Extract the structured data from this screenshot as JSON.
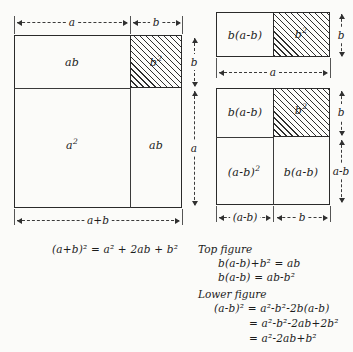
{
  "main_figure": {
    "name": "left-square-diagram",
    "cells": [
      {
        "id": "ab-top",
        "label": "ab",
        "sup": ""
      },
      {
        "id": "b-squared",
        "label": "b",
        "sup": "2"
      },
      {
        "id": "a-squared",
        "label": "a",
        "sup": "2"
      },
      {
        "id": "ab-right",
        "label": "ab",
        "sup": ""
      }
    ],
    "dimensions": {
      "top_left": "a",
      "top_right": "b",
      "right_upper": "b",
      "right_lower": "a",
      "bottom": "a+b"
    },
    "equation": "(a+b)² = a² + 2ab + b²"
  },
  "top_figure": {
    "name": "top-right-rectangle-diagram",
    "cells": [
      {
        "id": "b-a-minus-b",
        "label": "b(a-b)"
      },
      {
        "id": "b-squared",
        "label": "b",
        "sup": "2"
      }
    ],
    "dimensions": {
      "right": "b",
      "bottom": "a"
    }
  },
  "lower_figure": {
    "name": "lower-right-square-diagram",
    "cells": [
      {
        "id": "b-a-minus-b-top",
        "label": "b(a-b)"
      },
      {
        "id": "b-squared",
        "label": "b",
        "sup": "2"
      },
      {
        "id": "a-minus-b-squared",
        "label": "(a-b)",
        "sup": "2"
      },
      {
        "id": "b-a-minus-b-right",
        "label": "b(a-b)"
      }
    ],
    "dimensions": {
      "right_upper": "b",
      "right_lower": "a-b",
      "bottom_left": "(a-b)",
      "bottom_right": "b"
    }
  },
  "derivations": {
    "top_heading": "Top figure",
    "top_lines": [
      "b(a-b)+b² = ab",
      "b(a-b) = ab-b²"
    ],
    "lower_heading": "Lower figure",
    "lower_lines": [
      "(a-b)² = a²-b²-2b(a-b)",
      "= a²-b²-2ab+2b²",
      "= a²-2ab+b²"
    ]
  },
  "colors": {
    "ink": "#2a2a2a",
    "paper": "#fbfbf9",
    "hatch": "#2f2f2f"
  }
}
